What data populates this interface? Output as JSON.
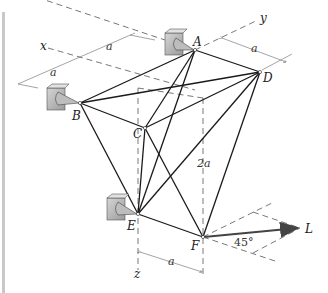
{
  "figure": {
    "axes": {
      "x": "x",
      "y": "y",
      "z": "z"
    },
    "nodes": {
      "A": "A",
      "B": "B",
      "C": "C",
      "D": "D",
      "E": "E",
      "F": "F"
    },
    "load_label": "L",
    "angle_label": "45°",
    "dimensions": {
      "x_dim_1": "a",
      "x_dim_2": "a",
      "y_dim": "a",
      "height": "2a",
      "bottom_dim": "a"
    },
    "supports": [
      "A",
      "B",
      "E"
    ],
    "members": [
      [
        "A",
        "B"
      ],
      [
        "A",
        "C"
      ],
      [
        "A",
        "D"
      ],
      [
        "A",
        "E"
      ],
      [
        "B",
        "C"
      ],
      [
        "B",
        "D"
      ],
      [
        "B",
        "E"
      ],
      [
        "C",
        "D"
      ],
      [
        "C",
        "E"
      ],
      [
        "C",
        "F"
      ],
      [
        "D",
        "E"
      ],
      [
        "D",
        "F"
      ],
      [
        "E",
        "F"
      ]
    ]
  }
}
